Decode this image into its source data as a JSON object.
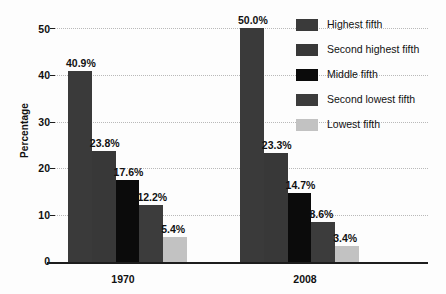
{
  "chart_data": {
    "type": "bar",
    "title": "",
    "subtitle": "",
    "xlabel": "",
    "ylabel": "Percentage",
    "ylim": [
      0,
      50
    ],
    "yticks": [
      0,
      10,
      20,
      30,
      40,
      50
    ],
    "ytick_labels": [
      "0",
      "10",
      "20",
      "30",
      "40",
      "50"
    ],
    "grid": "horizontal-dotted",
    "legend_position": "right",
    "categories": [
      "1970",
      "2008"
    ],
    "series": [
      {
        "name": "Highest fifth",
        "color": "#3a3a3a",
        "values": [
          40.9,
          50.0
        ],
        "labels": [
          "40.9%",
          "50.0%"
        ]
      },
      {
        "name": "Second highest fifth",
        "color": "#383838",
        "values": [
          23.8,
          23.3
        ],
        "labels": [
          "23.8%",
          "23.3%"
        ]
      },
      {
        "name": "Middle fifth",
        "color": "#0b0b0b",
        "values": [
          17.6,
          14.7
        ],
        "labels": [
          "17.6%",
          "14.7%"
        ]
      },
      {
        "name": "Second lowest fifth",
        "color": "#3c3c3c",
        "values": [
          12.2,
          8.6
        ],
        "labels": [
          "12.2%",
          "8.6%"
        ]
      },
      {
        "name": "Lowest fifth",
        "color": "#c2c2c2",
        "values": [
          5.4,
          3.4
        ],
        "labels": [
          "5.4%",
          "3.4%"
        ]
      }
    ]
  },
  "legend": {
    "items": [
      {
        "label": "Highest fifth",
        "color": "#3a3a3a"
      },
      {
        "label": "Second highest fifth",
        "color": "#383838"
      },
      {
        "label": "Middle fifth",
        "color": "#0b0b0b"
      },
      {
        "label": "Second lowest fifth",
        "color": "#3c3c3c"
      },
      {
        "label": "Lowest fifth",
        "color": "#c2c2c2"
      }
    ]
  },
  "axis": {
    "y_title": "Percentage",
    "y_tick_labels": [
      "50",
      "40",
      "30",
      "20",
      "10",
      "0"
    ],
    "x_group_labels": [
      "1970",
      "2008"
    ]
  },
  "colors": {
    "background": "#fdfdfd",
    "axis": "#1d1d1d",
    "gridline": "#b9b9b9",
    "text": "#111111"
  }
}
